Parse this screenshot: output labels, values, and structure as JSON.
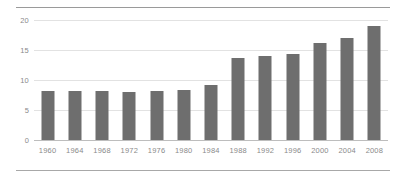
{
  "chart_data": {
    "type": "bar",
    "title": "",
    "subtitle": "",
    "xlabel": "",
    "ylabel": "",
    "categories": [
      "1960",
      "1964",
      "1968",
      "1972",
      "1976",
      "1980",
      "1984",
      "1988",
      "1992",
      "1996",
      "2000",
      "2004",
      "2008"
    ],
    "values": [
      8.2,
      8.1,
      8.1,
      8.0,
      8.1,
      8.3,
      9.1,
      13.7,
      14.0,
      14.3,
      16.1,
      17.0,
      19.0
    ],
    "series": [
      {
        "name": "",
        "values": [
          8.2,
          8.1,
          8.1,
          8.0,
          8.1,
          8.3,
          9.1,
          13.7,
          14.0,
          14.3,
          16.1,
          17.0,
          19.0
        ]
      }
    ],
    "ylim": [
      0,
      20
    ],
    "yticks": [
      "0",
      "5",
      "10",
      "15",
      "20"
    ],
    "ytick_values": [
      0,
      5,
      10,
      15,
      20
    ],
    "xticks": [
      "1960",
      "1964",
      "1968",
      "1972",
      "1976",
      "1980",
      "1984",
      "1988",
      "1992",
      "1996",
      "2000",
      "2004",
      "2008"
    ],
    "grid": true,
    "legend": false,
    "legend_position": "none",
    "annotations": [],
    "colors": {
      "bar": "#6e6e6e",
      "gridline": "#e2e2e2",
      "axis": "#bdbdbd",
      "tick_label": "#8a8a8a",
      "rule": "#9a9a9a",
      "background": "#ffffff"
    }
  }
}
